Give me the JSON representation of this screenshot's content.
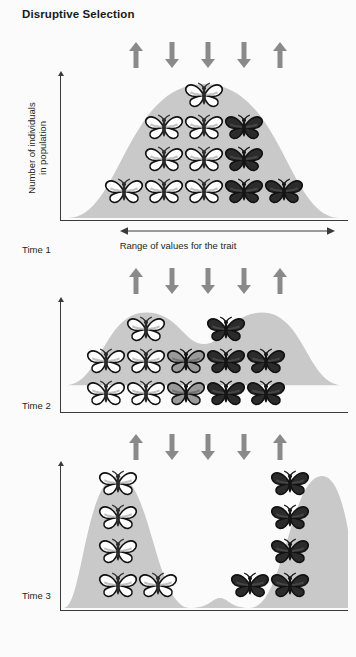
{
  "title": "Disruptive Selection",
  "axes": {
    "y_label_line1": "Number of individuals",
    "y_label_line2": "in population",
    "x_label": "Range of values for the trait"
  },
  "colors": {
    "background": "#fbfbfb",
    "curve_fill": "#c9c9c9",
    "arrow": "#8a8a8a",
    "axis": "#3a3a3a",
    "text": "#231f20",
    "butterfly_light": "#ffffff",
    "butterfly_mid": "#9a9a9a",
    "butterfly_dark": "#2b2b2b",
    "butterfly_outline": "#111111"
  },
  "selection_arrows": {
    "description": "Selection pressure arrows above each panel",
    "directions": [
      "up",
      "down",
      "down",
      "down",
      "up"
    ],
    "x_positions": [
      68,
      104,
      140,
      176,
      212
    ]
  },
  "panels": [
    {
      "id": "panel-1",
      "time_label": "Time 1",
      "curve_type": "unimodal",
      "curve_path": "M 8,150 C 60,150 66,16 144,16 C 222,16 228,150 280,150 Z",
      "show_x_axis": true,
      "show_x_label": true,
      "butterflies": [
        {
          "x": 124,
          "y": 14,
          "shade": "light"
        },
        {
          "x": 84,
          "y": 46,
          "shade": "light"
        },
        {
          "x": 124,
          "y": 46,
          "shade": "light"
        },
        {
          "x": 164,
          "y": 46,
          "shade": "dark"
        },
        {
          "x": 84,
          "y": 78,
          "shade": "light"
        },
        {
          "x": 124,
          "y": 78,
          "shade": "light"
        },
        {
          "x": 164,
          "y": 78,
          "shade": "dark"
        },
        {
          "x": 44,
          "y": 110,
          "shade": "light"
        },
        {
          "x": 84,
          "y": 110,
          "shade": "light"
        },
        {
          "x": 124,
          "y": 110,
          "shade": "light"
        },
        {
          "x": 164,
          "y": 110,
          "shade": "dark"
        },
        {
          "x": 204,
          "y": 110,
          "shade": "dark"
        }
      ]
    },
    {
      "id": "panel-2",
      "time_label": "Time 2",
      "curve_type": "bimodal-emerging",
      "curve_path": "M 6,118 C 40,118 44,26 86,26 C 118,26 124,66 144,66 C 164,66 170,26 202,26 C 244,26 248,118 282,118 Z",
      "show_x_axis": true,
      "show_x_label": false,
      "butterflies": [
        {
          "x": 66,
          "y": 24,
          "shade": "light"
        },
        {
          "x": 146,
          "y": 24,
          "shade": "dark"
        },
        {
          "x": 26,
          "y": 56,
          "shade": "light"
        },
        {
          "x": 66,
          "y": 56,
          "shade": "light"
        },
        {
          "x": 106,
          "y": 56,
          "shade": "mid"
        },
        {
          "x": 146,
          "y": 56,
          "shade": "dark"
        },
        {
          "x": 186,
          "y": 56,
          "shade": "dark"
        },
        {
          "x": 26,
          "y": 88,
          "shade": "light"
        },
        {
          "x": 66,
          "y": 88,
          "shade": "light"
        },
        {
          "x": 106,
          "y": 88,
          "shade": "mid"
        },
        {
          "x": 146,
          "y": 88,
          "shade": "dark"
        },
        {
          "x": 186,
          "y": 88,
          "shade": "dark"
        }
      ]
    },
    {
      "id": "panel-3",
      "time_label": "Time 3",
      "curve_type": "bimodal-separated",
      "curve_path": "M 4,150 C 22,150 26,18 58,18 C 90,18 96,150 130,150 C 150,150 152,140 160,140 C 168,140 170,150 190,150 C 224,150 230,18 262,18 C 292,18 294,150 300,150 Z",
      "show_x_axis": true,
      "show_x_label": false,
      "butterflies": [
        {
          "x": 38,
          "y": 12,
          "shade": "light"
        },
        {
          "x": 210,
          "y": 12,
          "shade": "dark"
        },
        {
          "x": 38,
          "y": 46,
          "shade": "light"
        },
        {
          "x": 210,
          "y": 46,
          "shade": "dark"
        },
        {
          "x": 38,
          "y": 80,
          "shade": "light"
        },
        {
          "x": 210,
          "y": 80,
          "shade": "dark"
        },
        {
          "x": 38,
          "y": 114,
          "shade": "light"
        },
        {
          "x": 78,
          "y": 114,
          "shade": "light"
        },
        {
          "x": 170,
          "y": 114,
          "shade": "dark"
        },
        {
          "x": 210,
          "y": 114,
          "shade": "dark"
        }
      ]
    }
  ]
}
